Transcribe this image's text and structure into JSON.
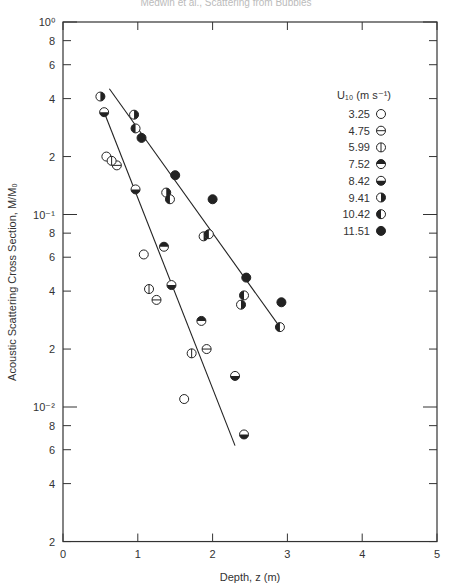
{
  "header": {
    "text": "Medwin et al., Scattering from Bubbles"
  },
  "chart_data": {
    "type": "scatter",
    "title": "",
    "xlabel": "Depth, z (m)",
    "ylabel": "Acoustic Scattering Cross Section, M/M₀",
    "xlim": [
      0,
      5
    ],
    "ylim": [
      0.002,
      1
    ],
    "yscale": "log",
    "x_ticks": [
      0,
      1,
      2,
      3,
      4,
      5
    ],
    "y_ticks": [
      {
        "value": 1,
        "label": "10⁰",
        "major": true
      },
      {
        "value": 0.8,
        "label": "8"
      },
      {
        "value": 0.6,
        "label": "6"
      },
      {
        "value": 0.4,
        "label": "4"
      },
      {
        "value": 0.2,
        "label": "2"
      },
      {
        "value": 0.1,
        "label": "10⁻¹",
        "major": true
      },
      {
        "value": 0.08,
        "label": "8"
      },
      {
        "value": 0.06,
        "label": "6"
      },
      {
        "value": 0.04,
        "label": "4"
      },
      {
        "value": 0.02,
        "label": "2"
      },
      {
        "value": 0.01,
        "label": "10⁻²",
        "major": true
      },
      {
        "value": 0.008,
        "label": "8"
      },
      {
        "value": 0.006,
        "label": "6"
      },
      {
        "value": 0.004,
        "label": "4"
      },
      {
        "value": 0.002,
        "label": "2"
      }
    ],
    "grid": false,
    "legend": {
      "title": "U₁₀ (m s⁻¹)",
      "position": "upper-right",
      "entries": [
        {
          "label": "3.25",
          "marker": "open"
        },
        {
          "label": "4.75",
          "marker": "horizontal-bar"
        },
        {
          "label": "5.99",
          "marker": "vertical-bar"
        },
        {
          "label": "7.52",
          "marker": "top-half-filled"
        },
        {
          "label": "8.42",
          "marker": "bottom-half-filled"
        },
        {
          "label": "9.41",
          "marker": "right-half-filled"
        },
        {
          "label": "10.42",
          "marker": "left-half-filled"
        },
        {
          "label": "11.51",
          "marker": "filled"
        }
      ]
    },
    "series": [
      {
        "name": "3.25",
        "marker": "open",
        "points": [
          [
            0.58,
            0.2
          ],
          [
            1.08,
            0.062
          ],
          [
            1.62,
            0.011
          ]
        ]
      },
      {
        "name": "4.75",
        "marker": "horizontal-bar",
        "points": [
          [
            0.72,
            0.18
          ],
          [
            1.25,
            0.036
          ],
          [
            1.92,
            0.02
          ]
        ]
      },
      {
        "name": "5.99",
        "marker": "vertical-bar",
        "points": [
          [
            0.65,
            0.19
          ],
          [
            1.15,
            0.041
          ],
          [
            1.72,
            0.019
          ]
        ]
      },
      {
        "name": "7.52",
        "marker": "top-half-filled",
        "points": [
          [
            1.35,
            0.068
          ],
          [
            1.85,
            0.028
          ]
        ]
      },
      {
        "name": "8.42",
        "marker": "bottom-half-filled",
        "points": [
          [
            0.55,
            0.34
          ],
          [
            0.97,
            0.135
          ],
          [
            1.45,
            0.043
          ],
          [
            2.3,
            0.0145
          ],
          [
            2.42,
            0.0072
          ]
        ]
      },
      {
        "name": "9.41",
        "marker": "right-half-filled",
        "points": [
          [
            0.5,
            0.41
          ],
          [
            0.95,
            0.33
          ],
          [
            1.38,
            0.13
          ],
          [
            1.88,
            0.077
          ],
          [
            2.38,
            0.034
          ]
        ]
      },
      {
        "name": "10.42",
        "marker": "left-half-filled",
        "points": [
          [
            0.97,
            0.28
          ],
          [
            1.43,
            0.12
          ],
          [
            1.95,
            0.079
          ],
          [
            2.42,
            0.038
          ],
          [
            2.9,
            0.026
          ]
        ]
      },
      {
        "name": "11.51",
        "marker": "filled",
        "points": [
          [
            1.05,
            0.25
          ],
          [
            1.5,
            0.16
          ],
          [
            2.0,
            0.12
          ],
          [
            2.45,
            0.047
          ],
          [
            2.92,
            0.035
          ]
        ]
      }
    ],
    "fit_lines": [
      {
        "name": "lower-fit",
        "from": [
          0.55,
          0.34
        ],
        "to": [
          2.3,
          0.0063
        ]
      },
      {
        "name": "upper-fit",
        "from": [
          0.62,
          0.45
        ],
        "to": [
          2.9,
          0.026
        ]
      }
    ]
  }
}
